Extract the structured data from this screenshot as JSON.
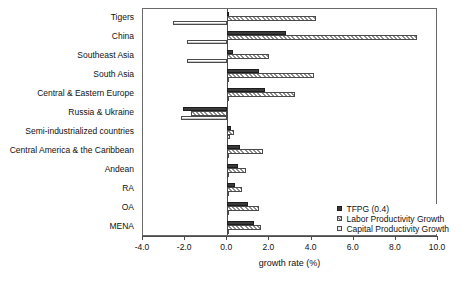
{
  "chart_data": {
    "type": "bar",
    "orientation": "horizontal",
    "title": "",
    "xlabel": "growth rate (%)",
    "ylabel": "",
    "xlim": [
      -4.0,
      10.0
    ],
    "xticks": [
      "-4.0",
      "-2.0",
      "0.0",
      "2.0",
      "4.0",
      "6.0",
      "8.0",
      "10.0"
    ],
    "xtick_values": [
      -4.0,
      -2.0,
      0.0,
      2.0,
      4.0,
      6.0,
      8.0,
      10.0
    ],
    "grid": false,
    "legend_position": "bottom-right",
    "categories": [
      "Tigers",
      "China",
      "Southeast Asia",
      "South Asia",
      "Central & Eastern Europe",
      "Russia & Ukraine",
      "Semi-industrialized countries",
      "Central America & the Caribbean",
      "Andean",
      "RA",
      "OA",
      "MENA"
    ],
    "series": [
      {
        "name": "TFPG (0.4)",
        "values": [
          0.1,
          2.8,
          0.25,
          1.5,
          1.8,
          -2.1,
          0.2,
          0.6,
          0.5,
          0.35,
          1.0,
          1.25
        ]
      },
      {
        "name": "Labor Productivity Growth",
        "values": [
          4.2,
          9.0,
          2.0,
          4.1,
          3.2,
          -1.7,
          0.3,
          1.7,
          0.9,
          0.7,
          1.5,
          1.6
        ]
      },
      {
        "name": "Capital Productivity Growth",
        "values": [
          -2.6,
          -1.9,
          -1.9,
          0.1,
          0.0,
          -2.2,
          0.15,
          0.0,
          0.0,
          0.0,
          0.0,
          0.1
        ]
      }
    ]
  },
  "legend": {
    "items": [
      {
        "label": "TFPG (0.4)",
        "swatch": "solid-dark"
      },
      {
        "label": "Labor Productivity Growth",
        "swatch": "hatched"
      },
      {
        "label": "Capital Productivity Growth",
        "swatch": "light-gray"
      }
    ]
  },
  "colors": {
    "tfpg": "#3a3a3a",
    "labor": "#8d8d8d",
    "capital": "#c9c9c9",
    "axis": "#4a4a4a",
    "text": "#111111",
    "background": "#ffffff"
  }
}
